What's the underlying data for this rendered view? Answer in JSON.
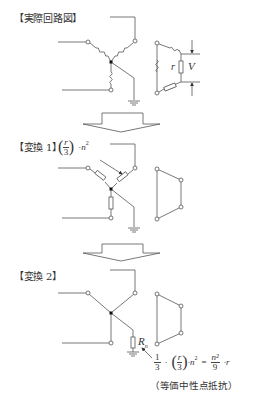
{
  "sections": [
    {
      "label": "【実際回路図】"
    },
    {
      "label": "【変換 1】"
    },
    {
      "label": "【変換 2】"
    }
  ],
  "annotations": {
    "delta_resistor": "r",
    "voltage": "V",
    "transform1_impedance": {
      "num": "r",
      "den": "3",
      "times": "·",
      "n": "n",
      "exp": "2"
    },
    "neutral_resistor": {
      "symbol": "R",
      "sub": "n"
    },
    "formula": {
      "a_num": "1",
      "a_den": "3",
      "dot1": "·",
      "b_num": "r",
      "b_den": "3",
      "dot2": "·n",
      "exp": "2",
      "eq": "=",
      "c_num": "n²",
      "c_den": "9",
      "dot3": "·r"
    },
    "equivalent_label": "（等価中性点抵抗）"
  },
  "colors": {
    "line": "#555555",
    "text": "#333333"
  }
}
